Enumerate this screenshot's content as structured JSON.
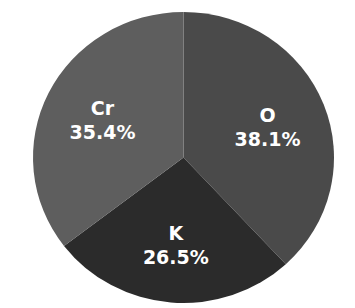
{
  "chart_data": {
    "type": "pie",
    "title": "",
    "start_angle_deg": 0,
    "direction": "clockwise",
    "slices": [
      {
        "label": "O",
        "value": 38.1,
        "display": "38.1%",
        "color": "#4a4a4a"
      },
      {
        "label": "K",
        "value": 26.5,
        "display": "26.5%",
        "color": "#2b2b2b"
      },
      {
        "label": "Cr",
        "value": 35.4,
        "display": "35.4%",
        "color": "#5e5e5e"
      }
    ],
    "legend": "none",
    "label_color": "#ffffff"
  }
}
